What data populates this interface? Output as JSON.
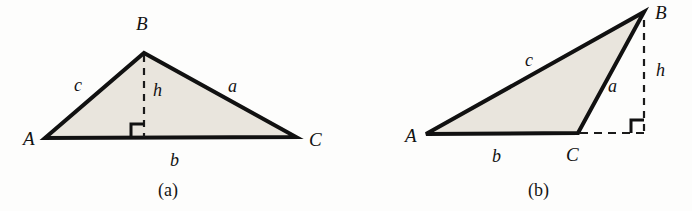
{
  "figure": {
    "background_color": "#fdfdfc",
    "fill_color": "#e9e5dd",
    "stroke_color": "#111111",
    "dash_color": "#1a1a1a",
    "panels": [
      {
        "id": "panel-a",
        "caption": "(a)",
        "description": "Acute triangle ABC with interior altitude h from B to base b",
        "vertices": [
          {
            "name": "A",
            "label": "A",
            "x": 45,
            "y": 138
          },
          {
            "name": "B",
            "label": "B",
            "x": 144,
            "y": 53
          },
          {
            "name": "C",
            "label": "C",
            "x": 296,
            "y": 137
          }
        ],
        "vertex_labels": [
          {
            "label": "A",
            "x": 23,
            "y": 145
          },
          {
            "label": "B",
            "x": 136,
            "y": 30
          },
          {
            "label": "C",
            "x": 309,
            "y": 146
          }
        ],
        "side_labels": [
          {
            "label": "c",
            "x": 74,
            "y": 91
          },
          {
            "label": "a",
            "x": 228,
            "y": 92
          },
          {
            "label": "b",
            "x": 170,
            "y": 166
          },
          {
            "label": "h",
            "x": 153,
            "y": 96
          }
        ],
        "altitude": {
          "foot_x": 144,
          "foot_y": 137,
          "top_x": 144,
          "top_y": 55
        },
        "right_angle": {
          "x": 144,
          "y": 137,
          "size": 13,
          "direction": "left-up"
        },
        "caption_pos": {
          "x": 158,
          "y": 196
        }
      },
      {
        "id": "panel-b",
        "caption": "(b)",
        "description": "Obtuse triangle ABC with exterior altitude h from B to extension of base b",
        "vertices": [
          {
            "name": "A",
            "label": "A",
            "x": 426,
            "y": 134
          },
          {
            "name": "B",
            "label": "B",
            "x": 644,
            "y": 12
          },
          {
            "name": "C",
            "label": "C",
            "x": 578,
            "y": 133
          }
        ],
        "vertex_labels": [
          {
            "label": "A",
            "x": 405,
            "y": 142
          },
          {
            "label": "B",
            "x": 655,
            "y": 19
          },
          {
            "label": "C",
            "x": 566,
            "y": 161
          }
        ],
        "side_labels": [
          {
            "label": "c",
            "x": 525,
            "y": 66
          },
          {
            "label": "a",
            "x": 608,
            "y": 92
          },
          {
            "label": "b",
            "x": 492,
            "y": 162
          },
          {
            "label": "h",
            "x": 656,
            "y": 76
          }
        ],
        "altitude": {
          "foot_x": 644,
          "foot_y": 133,
          "top_x": 644,
          "top_y": 20
        },
        "base_extension": {
          "from_x": 578,
          "from_y": 133,
          "to_x": 644,
          "to_y": 133
        },
        "right_angle": {
          "x": 644,
          "y": 133,
          "size": 13,
          "direction": "left-up"
        },
        "caption_pos": {
          "x": 528,
          "y": 196
        }
      }
    ]
  }
}
